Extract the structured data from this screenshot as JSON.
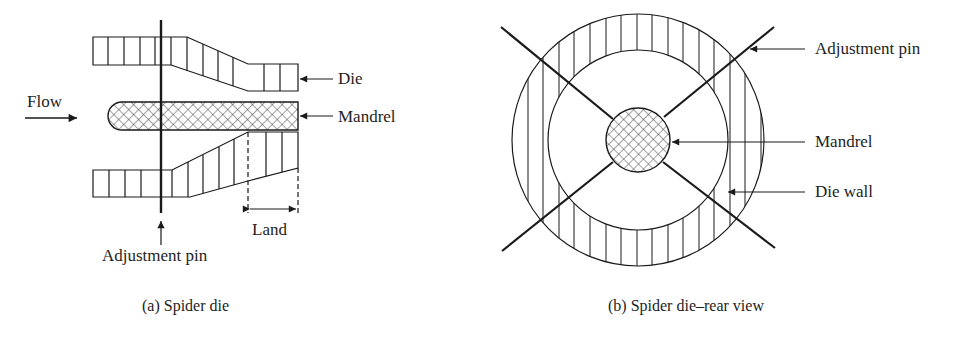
{
  "figure": {
    "panel_a": {
      "caption": "(a) Spider die",
      "labels": {
        "flow": "Flow",
        "die": "Die",
        "mandrel": "Mandrel",
        "land": "Land",
        "adjustment_pin": "Adjustment pin"
      }
    },
    "panel_b": {
      "caption": "(b) Spider die–rear view",
      "labels": {
        "adjustment_pin": "Adjustment pin",
        "mandrel": "Mandrel",
        "die_wall": "Die wall"
      }
    },
    "colors": {
      "line": "#1a1a1a",
      "background": "#ffffff"
    }
  }
}
